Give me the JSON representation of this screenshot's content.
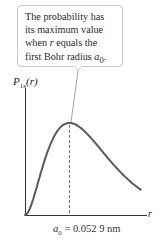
{
  "callout": {
    "lines": [
      "The probability has",
      "its maximum value",
      "when r equals the",
      "first Bohr radius a0."
    ],
    "line1": "The probability has",
    "line2": "its maximum value",
    "line3_pre": "when ",
    "line3_var": "r",
    "line3_post": " equals the",
    "line4_pre": "first Bohr radius ",
    "line4_var": "a",
    "line4_sub": "0",
    "line4_post": "."
  },
  "axes": {
    "ylabel_main": "P",
    "ylabel_sub": "1s",
    "ylabel_arg": "(r)",
    "xlabel": "r"
  },
  "marker": {
    "var": "a",
    "sub": "0",
    "value_text": " = 0.052 9 nm"
  },
  "colors": {
    "curve": "#5a5a5a",
    "axis": "#333333",
    "callout_border": "#c8c8c8",
    "leader": "#9a9a9a"
  },
  "chart_data": {
    "type": "line",
    "title": "",
    "xlabel": "r",
    "ylabel": "P1s(r)",
    "annotations": [
      "The probability has its maximum value when r equals the first Bohr radius a0.",
      "a0 = 0.052 9 nm"
    ],
    "x_units": "a0",
    "series": [
      {
        "name": "P1s(r) ∝ (r/a0)^2 e^(-2r/a0)",
        "x": [
          0,
          0.25,
          0.5,
          0.75,
          1.0,
          1.25,
          1.5,
          2.0,
          2.5,
          3.0,
          3.5
        ],
        "values": [
          0,
          0.228,
          0.544,
          0.862,
          1.0,
          0.94,
          0.843,
          0.542,
          0.312,
          0.165,
          0.083
        ]
      }
    ],
    "peak": {
      "x": 1.0,
      "label": "a0 = 0.052 9 nm"
    },
    "grid": false,
    "legend": "none"
  }
}
